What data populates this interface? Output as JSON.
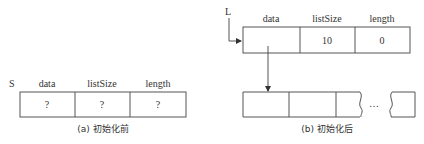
{
  "before": {
    "variable": "S",
    "fields": [
      {
        "name": "data",
        "value": "?"
      },
      {
        "name": "listSize",
        "value": "?"
      },
      {
        "name": "length",
        "value": "?"
      }
    ],
    "caption": "(a) 初始化前"
  },
  "after": {
    "variable": "L",
    "fields": [
      {
        "name": "data",
        "value": ""
      },
      {
        "name": "listSize",
        "value": "10"
      },
      {
        "name": "length",
        "value": "0"
      }
    ],
    "array_ellipsis": "…",
    "caption": "(b) 初始化后"
  }
}
